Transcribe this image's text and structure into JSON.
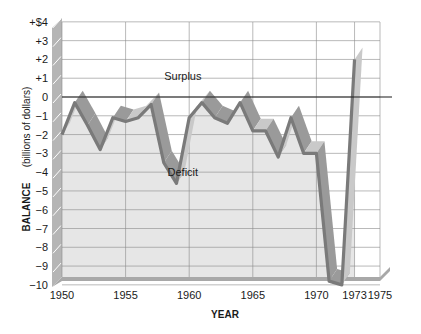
{
  "chart_data": {
    "type": "line",
    "title": "",
    "xlabel": "YEAR",
    "ylabel": "BALANCE",
    "ylabel_unit": "(billions of dollars)",
    "x_tick_labels": [
      "1950",
      "1955",
      "1960",
      "1965",
      "1970",
      "1973",
      "1975"
    ],
    "y_tick_labels": [
      "+$4",
      "+3",
      "+2",
      "+1",
      "0",
      "−1",
      "−2",
      "−3",
      "−4",
      "−5",
      "−6",
      "−7",
      "−8",
      "−9",
      "−10"
    ],
    "xlim": [
      1950,
      1975
    ],
    "ylim": [
      -10,
      4
    ],
    "grid": true,
    "legend": null,
    "annotations": [
      {
        "text": "Surplus",
        "x": 1959.5,
        "y": 0.9
      },
      {
        "text": "Deficit",
        "x": 1959.5,
        "y": -4.2
      }
    ],
    "x": [
      1950,
      1951,
      1952,
      1953,
      1954,
      1955,
      1956,
      1957,
      1958,
      1959,
      1960,
      1961,
      1962,
      1963,
      1964,
      1965,
      1966,
      1967,
      1968,
      1969,
      1970,
      1971,
      1972,
      1973
    ],
    "series": [
      {
        "name": "Balance",
        "values": [
          -2.0,
          -0.3,
          -1.5,
          -2.8,
          -1.1,
          -1.3,
          -1.1,
          -0.4,
          -3.5,
          -4.6,
          -1.1,
          -0.3,
          -1.1,
          -1.4,
          -0.3,
          -1.8,
          -1.8,
          -3.2,
          -1.1,
          -3.0,
          -3.0,
          -9.8,
          -10.0,
          2.0
        ]
      }
    ],
    "zero_line": true
  },
  "labels": {
    "ylabel_bold": "BALANCE",
    "ylabel_unit": "(billions of dollars)",
    "xlabel": "YEAR",
    "surplus": "Surplus",
    "deficit": "Deficit"
  },
  "colors": {
    "line": "#7a7a7a",
    "ribbon_light": "#c9c9c9",
    "ribbon_dark": "#9a9a9a",
    "fill": "#e6e6e6",
    "grid": "#8a8a8a",
    "zero_line": "#1a1a1a",
    "floor": "#a8a8a8",
    "wall": "#b5b5b5"
  }
}
